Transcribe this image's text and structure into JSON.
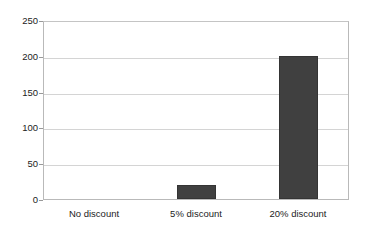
{
  "chart_data": {
    "type": "bar",
    "title": "",
    "subtitle": "",
    "xlabel": "",
    "ylabel": "",
    "categories": [
      "No discount",
      "5% discount",
      "20% discount"
    ],
    "values": [
      0,
      20,
      200
    ],
    "series": [
      {
        "name": "",
        "values": [
          0,
          20,
          200
        ]
      }
    ],
    "ylim": [
      0,
      250
    ],
    "yticks": [
      0,
      50,
      100,
      150,
      200,
      250
    ],
    "ytick_labels": [
      "0",
      "50",
      "100",
      "150",
      "200",
      "250"
    ],
    "grid": "horizontal",
    "legend": "none",
    "bar_color": "#404040",
    "gridline_color": "#d4d4d4",
    "axis_color": "#b9b9b9",
    "text_color": "#1c1c1c",
    "background": "#ffffff",
    "annotations": []
  }
}
